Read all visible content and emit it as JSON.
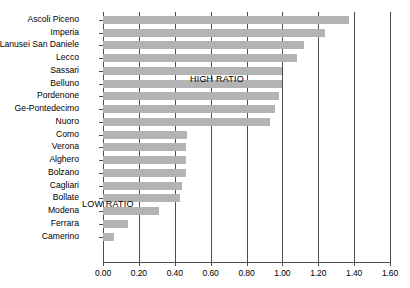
{
  "chart_data": {
    "type": "bar",
    "orientation": "horizontal",
    "title": "",
    "xlabel": "",
    "ylabel": "",
    "xlim": [
      0.0,
      1.6
    ],
    "xticks": [
      "0.00",
      "0.20",
      "0.40",
      "0.60",
      "0.80",
      "1.00",
      "1.20",
      "1.40",
      "1.60"
    ],
    "xtick_values": [
      0.0,
      0.2,
      0.4,
      0.6,
      0.8,
      1.0,
      1.2,
      1.4,
      1.6
    ],
    "grid": true,
    "legend": "none",
    "bar_color": "#b3b3b3",
    "axis_color": "#4d4d4d",
    "categories": [
      "Ascoli Piceno",
      "Imperia",
      "Lanusei San Daniele",
      "Lecco",
      "Sassari",
      "Belluno",
      "Pordenone",
      "Ge-Pontedecimo",
      "Nuoro",
      "Como",
      "Verona",
      "Alghero",
      "Bolzano",
      "Cagliari",
      "Bollate",
      "Modena",
      "Ferrara",
      "Camerino"
    ],
    "values": [
      1.37,
      1.24,
      1.12,
      1.08,
      1.0,
      1.0,
      0.98,
      0.96,
      0.93,
      0.47,
      0.46,
      0.46,
      0.46,
      0.44,
      0.43,
      0.31,
      0.14,
      0.06
    ],
    "annotations": [
      {
        "text": "HIGH RATIO",
        "x": 1.04,
        "y_category": "Pordenone"
      },
      {
        "text": "LOW RATIO",
        "x": 0.44,
        "y_category": "Bollate"
      }
    ]
  }
}
